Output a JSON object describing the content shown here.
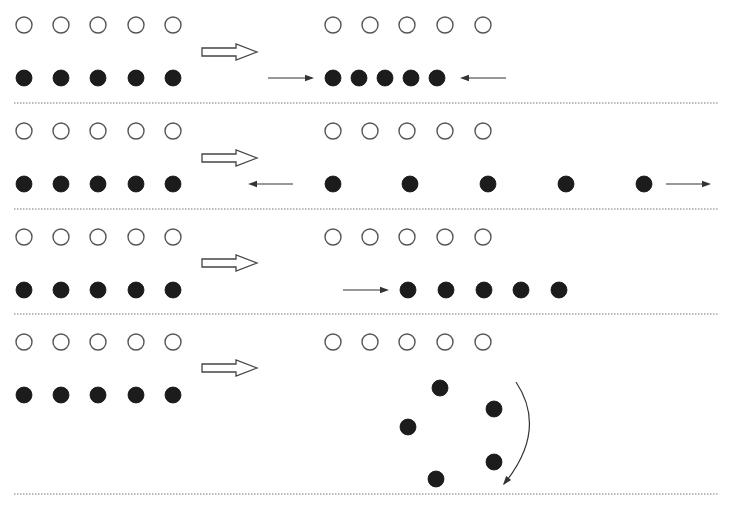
{
  "diagram": {
    "title": "",
    "colors": {
      "background": "#ffffff",
      "filled_circle": "#1c1c1c",
      "open_circle_stroke": "#555555",
      "divider": "#777777",
      "arrow": "#333333"
    },
    "circle_radius": 8,
    "left_columns_x": [
      24,
      61,
      98,
      136,
      173
    ],
    "right_open_columns_x": [
      333,
      370,
      407,
      445,
      483
    ],
    "panels": [
      {
        "id": "panel-1-compress",
        "open_y": 25,
        "filled_y": 78,
        "divider_y": 103,
        "transition_arrow_y": 52,
        "right_filled": [
          [
            333,
            78
          ],
          [
            359,
            78
          ],
          [
            385,
            78
          ],
          [
            411,
            78
          ],
          [
            437,
            78
          ]
        ],
        "line_arrows": [
          {
            "name": "push-right-arrow",
            "x1": 268,
            "y1": 78,
            "x2": 314,
            "y2": 78
          },
          {
            "name": "push-left-arrow",
            "x1": 506,
            "y1": 78,
            "x2": 460,
            "y2": 78
          }
        ]
      },
      {
        "id": "panel-2-expand",
        "open_y": 131,
        "filled_y": 184,
        "divider_y": 209,
        "transition_arrow_y": 158,
        "right_filled": [
          [
            333,
            184
          ],
          [
            410,
            184
          ],
          [
            488,
            184
          ],
          [
            566,
            184
          ],
          [
            644,
            184
          ]
        ],
        "line_arrows": [
          {
            "name": "pull-left-arrow",
            "x1": 293,
            "y1": 184,
            "x2": 248,
            "y2": 184
          },
          {
            "name": "pull-right-arrow",
            "x1": 666,
            "y1": 184,
            "x2": 711,
            "y2": 184
          }
        ]
      },
      {
        "id": "panel-3-shift",
        "open_y": 237,
        "filled_y": 290,
        "divider_y": 314,
        "transition_arrow_y": 263,
        "right_filled": [
          [
            408,
            290
          ],
          [
            446,
            290
          ],
          [
            484,
            290
          ],
          [
            521,
            290
          ],
          [
            559,
            290
          ]
        ],
        "line_arrows": [
          {
            "name": "shift-right-arrow",
            "x1": 343,
            "y1": 290,
            "x2": 389,
            "y2": 290
          }
        ]
      },
      {
        "id": "panel-4-rotate",
        "open_y": 342,
        "filled_y": 395,
        "divider_y": 494,
        "transition_arrow_y": 368,
        "right_filled": [
          [
            440,
            388
          ],
          [
            494,
            409
          ],
          [
            408,
            427
          ],
          [
            494,
            462
          ],
          [
            436,
            479
          ]
        ],
        "curved_arrow": {
          "name": "rotation-arrow",
          "path": "M516,382 Q548,430 504,484"
        },
        "line_arrows": []
      }
    ]
  }
}
